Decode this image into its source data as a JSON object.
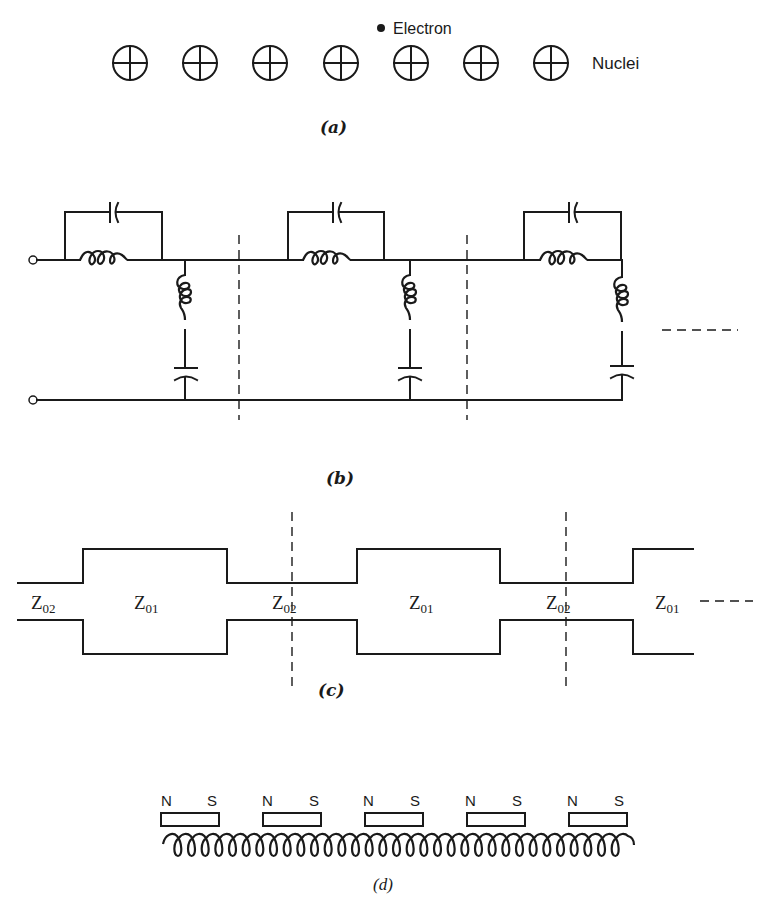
{
  "figure": {
    "panel_a": {
      "caption": "(a)",
      "electron_label": "Electron",
      "nuclei_label": "Nuclei",
      "nuclei_count": 7,
      "nucleus_icon": "circle-with-cross"
    },
    "panel_b": {
      "caption": "(b)",
      "description": "Periodic LC ladder network: three sections, each a series parallel-LC tank followed by a shunt series-LC branch, separated by dashed section boundaries, continuation dashes at right",
      "section_count": 3
    },
    "panel_c": {
      "caption": "(c)",
      "description": "Periodically stepped transmission line alternating impedances",
      "segment_labels": [
        {
          "main": "Z",
          "sub": "02"
        },
        {
          "main": "Z",
          "sub": "01"
        },
        {
          "main": "Z",
          "sub": "02"
        },
        {
          "main": "Z",
          "sub": "01"
        },
        {
          "main": "Z",
          "sub": "02"
        },
        {
          "main": "Z",
          "sub": "01"
        }
      ]
    },
    "panel_d": {
      "caption": "(d)",
      "magnets": [
        {
          "north": "N",
          "south": "S"
        },
        {
          "north": "N",
          "south": "S"
        },
        {
          "north": "N",
          "south": "S"
        },
        {
          "north": "N",
          "south": "S"
        },
        {
          "north": "N",
          "south": "S"
        }
      ],
      "description": "Periodic array of bar magnets above a helical electron path"
    }
  }
}
